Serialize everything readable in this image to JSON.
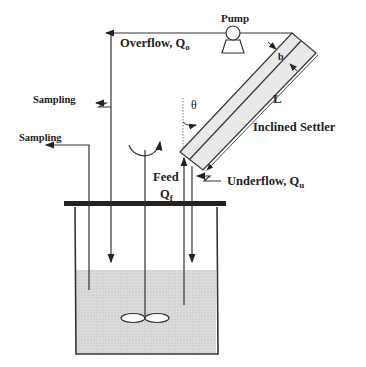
{
  "diagram": {
    "labels": {
      "pump": "Pump",
      "overflow": "Overflow, Q",
      "overflow_sub": "o",
      "sampling_top": "Sampling",
      "sampling_left": "Sampling",
      "theta": "θ",
      "length": "L",
      "width": "b",
      "settler": "Inclined Settler",
      "feed": "Feed",
      "feed_q": "Q",
      "feed_sub": "f",
      "underflow": "Underflow, Q",
      "underflow_sub": "u"
    },
    "colors": {
      "line": "#333333",
      "liquid": "#d9d9d9",
      "settler_fill": "#e6e6e6"
    }
  }
}
